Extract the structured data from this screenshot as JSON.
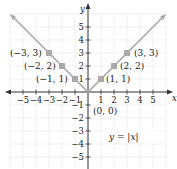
{
  "figure": {
    "equation_label": "y = |x|",
    "x_axis_label": "x",
    "y_axis_label": "y",
    "x_ticks": [
      "−5",
      "−4",
      "−3",
      "−2",
      "−1",
      "1",
      "2",
      "3",
      "4",
      "5"
    ],
    "y_ticks": [
      "5",
      "4",
      "3",
      "2",
      "1",
      "−1",
      "−2",
      "−3",
      "−4",
      "−5"
    ],
    "points": [
      {
        "label": "(−3, 3)",
        "x": -3,
        "y": 3
      },
      {
        "label": "(−2, 2)",
        "x": -2,
        "y": 2
      },
      {
        "label": "(−1, 1)",
        "x": -1,
        "y": 1
      },
      {
        "label": "(0, 0)",
        "x": 0,
        "y": 0
      },
      {
        "label": "(1, 1)",
        "x": 1,
        "y": 1
      },
      {
        "label": "(2, 2)",
        "x": 2,
        "y": 2
      },
      {
        "label": "(3, 3)",
        "x": 3,
        "y": 3
      }
    ],
    "colors": {
      "line": "#a9a9a9",
      "point": "#a9a9a9",
      "grid": "#dcdcdc",
      "axis": "#333333"
    }
  }
}
